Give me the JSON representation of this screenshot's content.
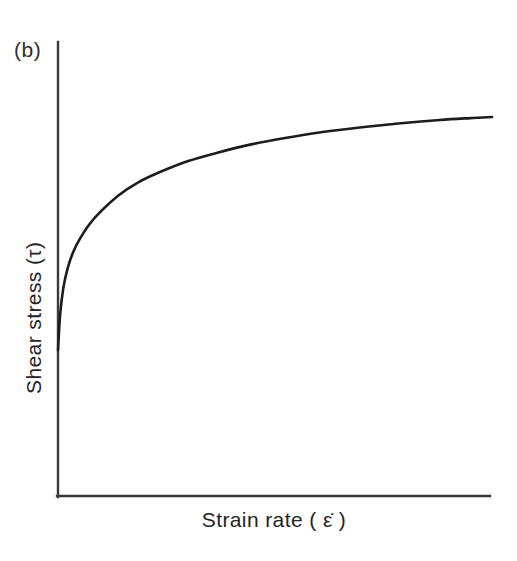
{
  "figure": {
    "panel_label": "(b)",
    "x_axis_label": "Strain rate  ( ε̇ )",
    "y_axis_label": "Shear stress (τ)",
    "background_color": "#ffffff",
    "line_color": "#1c1c1c",
    "axis_color": "#3a3a3a"
  },
  "chart_data": {
    "type": "line",
    "title": "",
    "subtitle": "",
    "xlabel": "Strain rate ( ε̇ )",
    "ylabel": "Shear stress (τ)",
    "annotations": [
      "(b)"
    ],
    "legend": [],
    "legend_position": "none",
    "grid": false,
    "axis_ticks": false,
    "tick_labels": {
      "x": [],
      "y": []
    },
    "xlim": [
      0,
      1
    ],
    "ylim": [
      0,
      1
    ],
    "series": [
      {
        "name": "Pseudoplastic (shear-thinning) flow curve",
        "description": "Shear stress rises very steeply from a finite intercept at zero strain rate, then curves over and approaches a horizontal asymptote.",
        "x": [
          0.0,
          0.005,
          0.012,
          0.022,
          0.035,
          0.05,
          0.072,
          0.098,
          0.14,
          0.185,
          0.235,
          0.3,
          0.365,
          0.44,
          0.52,
          0.61,
          0.7,
          0.79,
          0.88,
          0.95,
          1.0
        ],
        "y": [
          0.323,
          0.42,
          0.49,
          0.545,
          0.59,
          0.625,
          0.665,
          0.7,
          0.745,
          0.78,
          0.808,
          0.838,
          0.86,
          0.882,
          0.9,
          0.917,
          0.93,
          0.941,
          0.95,
          0.955,
          0.958
        ]
      }
    ]
  },
  "geometry": {
    "origin_x": 57,
    "origin_y": 497,
    "y_axis_top": 42,
    "x_axis_right": 490,
    "curve_start_y": 350,
    "curve_end_y": 117
  }
}
